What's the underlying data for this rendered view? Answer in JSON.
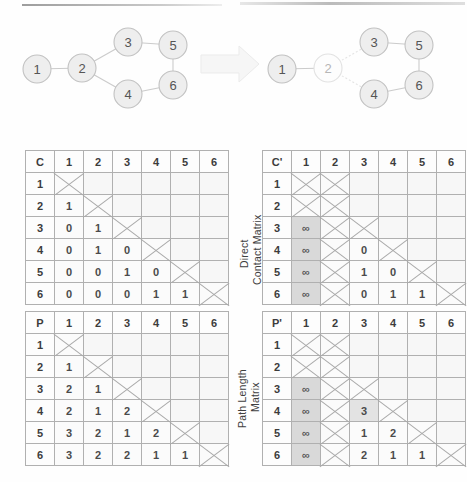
{
  "figure": {
    "graph_before": {
      "name": "original-network",
      "nodes": [
        {
          "id": "1",
          "x": 29,
          "y": 57,
          "state": "present"
        },
        {
          "id": "2",
          "x": 74,
          "y": 56,
          "state": "present"
        },
        {
          "id": "3",
          "x": 120,
          "y": 30,
          "state": "present"
        },
        {
          "id": "4",
          "x": 120,
          "y": 82,
          "state": "present"
        },
        {
          "id": "5",
          "x": 165,
          "y": 33,
          "state": "present"
        },
        {
          "id": "6",
          "x": 165,
          "y": 73,
          "state": "present"
        }
      ],
      "edges": [
        {
          "from": "1",
          "to": "2",
          "state": "present"
        },
        {
          "from": "2",
          "to": "3",
          "state": "present"
        },
        {
          "from": "2",
          "to": "4",
          "state": "present"
        },
        {
          "from": "3",
          "to": "5",
          "state": "present"
        },
        {
          "from": "4",
          "to": "6",
          "state": "present"
        },
        {
          "from": "5",
          "to": "6",
          "state": "present"
        }
      ]
    },
    "graph_after": {
      "name": "network-with-node-2-removed",
      "nodes": [
        {
          "id": "1",
          "x": 30,
          "y": 57,
          "state": "present"
        },
        {
          "id": "2",
          "x": 76,
          "y": 56,
          "state": "removed"
        },
        {
          "id": "3",
          "x": 122,
          "y": 30,
          "state": "present"
        },
        {
          "id": "4",
          "x": 122,
          "y": 82,
          "state": "present"
        },
        {
          "id": "5",
          "x": 167,
          "y": 33,
          "state": "present"
        },
        {
          "id": "6",
          "x": 167,
          "y": 73,
          "state": "present"
        }
      ],
      "edges": [
        {
          "from": "1",
          "to": "2",
          "state": "present"
        },
        {
          "from": "2",
          "to": "3",
          "state": "removed"
        },
        {
          "from": "2",
          "to": "4",
          "state": "removed"
        },
        {
          "from": "3",
          "to": "5",
          "state": "present"
        },
        {
          "from": "4",
          "to": "6",
          "state": "present"
        },
        {
          "from": "5",
          "to": "6",
          "state": "present"
        }
      ]
    },
    "arrow": {
      "name": "transition-arrow",
      "direction": "right",
      "color": "#f3f3f3"
    }
  },
  "labels": {
    "direct_contact_line1": "Direct",
    "direct_contact_line2": "Contact Matrix",
    "path_length_line1": "Path Length",
    "path_length_line2": "Matrix"
  },
  "colors": {
    "node_fill": "#eeeeee",
    "node_stroke": "#c2c2c2",
    "edge": "#cbcbcb",
    "grid_line": "#b0b0b0",
    "shaded_cell": "#d9d9d9",
    "cell_background": "#fbfbfb",
    "text": "#4b4b4b"
  },
  "symbols": {
    "infinity": "∞",
    "cross": "X"
  },
  "matrices": {
    "c": {
      "name": "direct-contact-matrix-original",
      "corner": "C",
      "columns": [
        "1",
        "2",
        "3",
        "4",
        "5",
        "6"
      ],
      "rows": [
        {
          "header": "1",
          "cells": [
            {
              "t": "cross"
            },
            {
              "t": "empty"
            },
            {
              "t": "empty"
            },
            {
              "t": "empty"
            },
            {
              "t": "empty"
            },
            {
              "t": "empty"
            }
          ]
        },
        {
          "header": "2",
          "cells": [
            {
              "t": "val",
              "v": "1"
            },
            {
              "t": "cross"
            },
            {
              "t": "empty"
            },
            {
              "t": "empty"
            },
            {
              "t": "empty"
            },
            {
              "t": "empty"
            }
          ]
        },
        {
          "header": "3",
          "cells": [
            {
              "t": "val",
              "v": "0"
            },
            {
              "t": "val",
              "v": "1"
            },
            {
              "t": "cross"
            },
            {
              "t": "empty"
            },
            {
              "t": "empty"
            },
            {
              "t": "empty"
            }
          ]
        },
        {
          "header": "4",
          "cells": [
            {
              "t": "val",
              "v": "0"
            },
            {
              "t": "val",
              "v": "1"
            },
            {
              "t": "val",
              "v": "0"
            },
            {
              "t": "cross"
            },
            {
              "t": "empty"
            },
            {
              "t": "empty"
            }
          ]
        },
        {
          "header": "5",
          "cells": [
            {
              "t": "val",
              "v": "0"
            },
            {
              "t": "val",
              "v": "0"
            },
            {
              "t": "val",
              "v": "1"
            },
            {
              "t": "val",
              "v": "0"
            },
            {
              "t": "cross"
            },
            {
              "t": "empty"
            }
          ]
        },
        {
          "header": "6",
          "cells": [
            {
              "t": "val",
              "v": "0"
            },
            {
              "t": "val",
              "v": "0"
            },
            {
              "t": "val",
              "v": "0"
            },
            {
              "t": "val",
              "v": "1"
            },
            {
              "t": "val",
              "v": "1"
            },
            {
              "t": "cross"
            }
          ]
        }
      ]
    },
    "c_prime": {
      "name": "direct-contact-matrix-after-removal",
      "corner": "C'",
      "columns": [
        "1",
        "2",
        "3",
        "4",
        "5",
        "6"
      ],
      "rows": [
        {
          "header": "1",
          "cells": [
            {
              "t": "cross"
            },
            {
              "t": "cross"
            },
            {
              "t": "empty"
            },
            {
              "t": "empty"
            },
            {
              "t": "empty"
            },
            {
              "t": "empty"
            }
          ]
        },
        {
          "header": "2",
          "cells": [
            {
              "t": "cross"
            },
            {
              "t": "cross"
            },
            {
              "t": "empty"
            },
            {
              "t": "empty"
            },
            {
              "t": "empty"
            },
            {
              "t": "empty"
            }
          ]
        },
        {
          "header": "3",
          "cells": [
            {
              "t": "inf",
              "v": "∞",
              "shade": "shaded"
            },
            {
              "t": "cross"
            },
            {
              "t": "cross"
            },
            {
              "t": "empty"
            },
            {
              "t": "empty"
            },
            {
              "t": "empty"
            }
          ]
        },
        {
          "header": "4",
          "cells": [
            {
              "t": "inf",
              "v": "∞",
              "shade": "shaded"
            },
            {
              "t": "cross"
            },
            {
              "t": "val",
              "v": "0"
            },
            {
              "t": "cross"
            },
            {
              "t": "empty"
            },
            {
              "t": "empty"
            }
          ]
        },
        {
          "header": "5",
          "cells": [
            {
              "t": "inf",
              "v": "∞",
              "shade": "shaded"
            },
            {
              "t": "cross"
            },
            {
              "t": "val",
              "v": "1"
            },
            {
              "t": "val",
              "v": "0"
            },
            {
              "t": "cross"
            },
            {
              "t": "empty"
            }
          ]
        },
        {
          "header": "6",
          "cells": [
            {
              "t": "inf",
              "v": "∞",
              "shade": "shaded"
            },
            {
              "t": "cross"
            },
            {
              "t": "val",
              "v": "0"
            },
            {
              "t": "val",
              "v": "1"
            },
            {
              "t": "val",
              "v": "1"
            },
            {
              "t": "cross"
            }
          ]
        }
      ]
    },
    "p": {
      "name": "path-length-matrix-original",
      "corner": "P",
      "columns": [
        "1",
        "2",
        "3",
        "4",
        "5",
        "6"
      ],
      "rows": [
        {
          "header": "1",
          "cells": [
            {
              "t": "cross"
            },
            {
              "t": "empty"
            },
            {
              "t": "empty"
            },
            {
              "t": "empty"
            },
            {
              "t": "empty"
            },
            {
              "t": "empty"
            }
          ]
        },
        {
          "header": "2",
          "cells": [
            {
              "t": "val",
              "v": "1"
            },
            {
              "t": "cross"
            },
            {
              "t": "empty"
            },
            {
              "t": "empty"
            },
            {
              "t": "empty"
            },
            {
              "t": "empty"
            }
          ]
        },
        {
          "header": "3",
          "cells": [
            {
              "t": "val",
              "v": "2"
            },
            {
              "t": "val",
              "v": "1"
            },
            {
              "t": "cross"
            },
            {
              "t": "empty"
            },
            {
              "t": "empty"
            },
            {
              "t": "empty"
            }
          ]
        },
        {
          "header": "4",
          "cells": [
            {
              "t": "val",
              "v": "2"
            },
            {
              "t": "val",
              "v": "1"
            },
            {
              "t": "val",
              "v": "2"
            },
            {
              "t": "cross"
            },
            {
              "t": "empty"
            },
            {
              "t": "empty"
            }
          ]
        },
        {
          "header": "5",
          "cells": [
            {
              "t": "val",
              "v": "3"
            },
            {
              "t": "val",
              "v": "2"
            },
            {
              "t": "val",
              "v": "1"
            },
            {
              "t": "val",
              "v": "2"
            },
            {
              "t": "cross"
            },
            {
              "t": "empty"
            }
          ]
        },
        {
          "header": "6",
          "cells": [
            {
              "t": "val",
              "v": "3"
            },
            {
              "t": "val",
              "v": "2"
            },
            {
              "t": "val",
              "v": "2"
            },
            {
              "t": "val",
              "v": "1"
            },
            {
              "t": "val",
              "v": "1"
            },
            {
              "t": "cross"
            }
          ]
        }
      ]
    },
    "p_prime": {
      "name": "path-length-matrix-after-removal",
      "corner": "P'",
      "columns": [
        "1",
        "2",
        "3",
        "4",
        "5",
        "6"
      ],
      "rows": [
        {
          "header": "1",
          "cells": [
            {
              "t": "cross"
            },
            {
              "t": "cross"
            },
            {
              "t": "empty"
            },
            {
              "t": "empty"
            },
            {
              "t": "empty"
            },
            {
              "t": "empty"
            }
          ]
        },
        {
          "header": "2",
          "cells": [
            {
              "t": "cross"
            },
            {
              "t": "cross"
            },
            {
              "t": "empty"
            },
            {
              "t": "empty"
            },
            {
              "t": "empty"
            },
            {
              "t": "empty"
            }
          ]
        },
        {
          "header": "3",
          "cells": [
            {
              "t": "inf",
              "v": "∞",
              "shade": "shaded"
            },
            {
              "t": "cross"
            },
            {
              "t": "cross"
            },
            {
              "t": "empty"
            },
            {
              "t": "empty"
            },
            {
              "t": "empty"
            }
          ]
        },
        {
          "header": "4",
          "cells": [
            {
              "t": "inf",
              "v": "∞",
              "shade": "shaded"
            },
            {
              "t": "cross"
            },
            {
              "t": "val",
              "v": "3",
              "shade": "shaded-light"
            },
            {
              "t": "cross"
            },
            {
              "t": "empty"
            },
            {
              "t": "empty"
            }
          ]
        },
        {
          "header": "5",
          "cells": [
            {
              "t": "inf",
              "v": "∞",
              "shade": "shaded"
            },
            {
              "t": "cross"
            },
            {
              "t": "val",
              "v": "1"
            },
            {
              "t": "val",
              "v": "2"
            },
            {
              "t": "cross"
            },
            {
              "t": "empty"
            }
          ]
        },
        {
          "header": "6",
          "cells": [
            {
              "t": "inf",
              "v": "∞",
              "shade": "shaded"
            },
            {
              "t": "cross"
            },
            {
              "t": "val",
              "v": "2"
            },
            {
              "t": "val",
              "v": "1"
            },
            {
              "t": "val",
              "v": "1"
            },
            {
              "t": "cross"
            }
          ]
        }
      ]
    }
  }
}
